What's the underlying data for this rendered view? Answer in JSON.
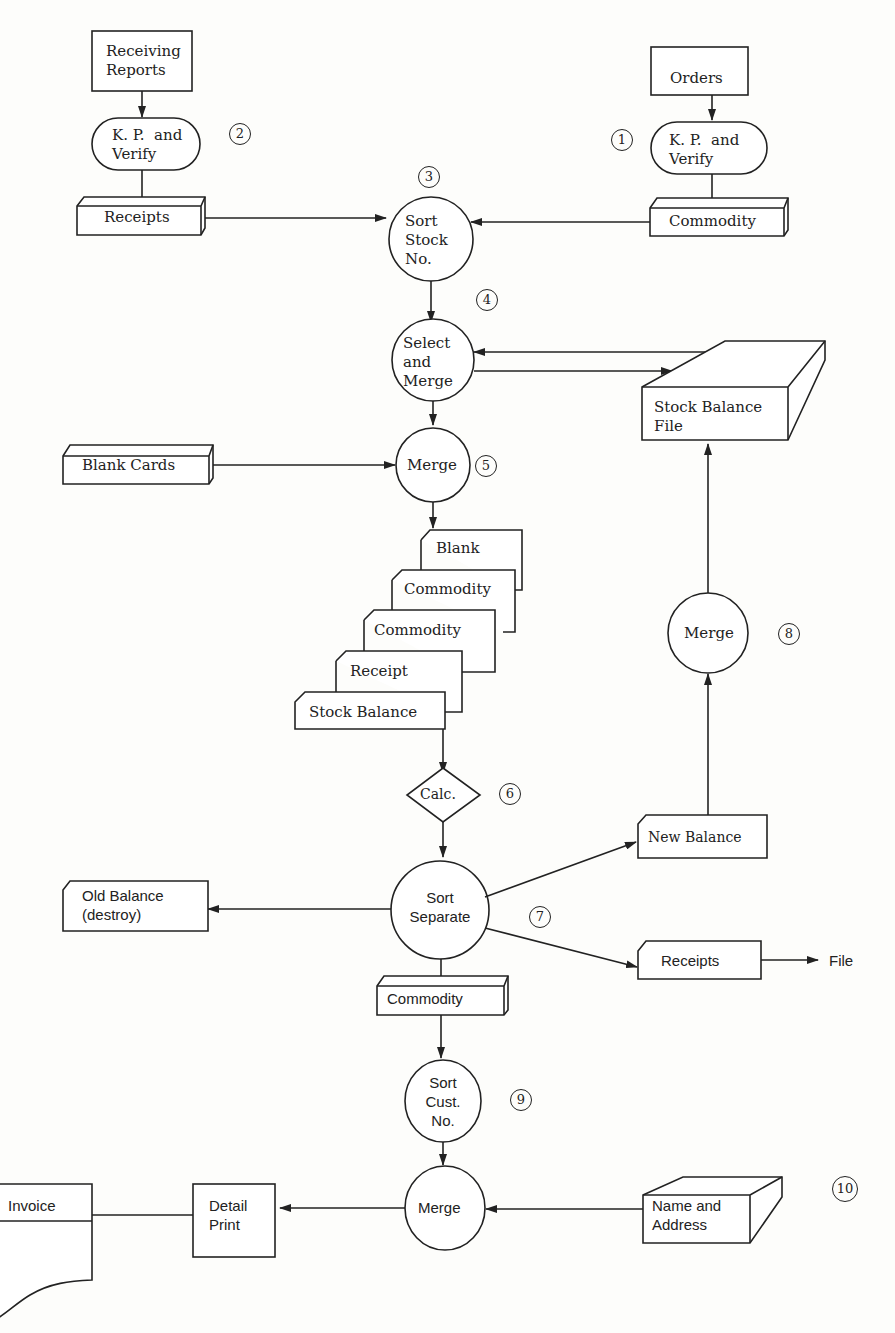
{
  "diagram": {
    "nodes": {
      "receiving_reports": "Receiving\nReports",
      "kp_verify_left": "K. P.  and\nVerify",
      "receipts_top": "Receipts",
      "orders": "Orders",
      "kp_verify_right": "K. P.  and\nVerify",
      "commodity_top": "Commodity",
      "sort_stock_no": "Sort\nStock\nNo.",
      "select_and_merge": "Select\nand\nMerge",
      "stock_balance_file": "Stock Balance\nFile",
      "blank_cards": "Blank Cards",
      "merge_5": "Merge",
      "deck_blank": "Blank",
      "deck_commodity_1": "Commodity",
      "deck_commodity_2": "Commodity",
      "deck_receipt": "Receipt",
      "deck_stock_balance": "Stock Balance",
      "calc": "Calc.",
      "merge_8": "Merge",
      "new_balance": "New Balance",
      "sort_separate": "Sort\nSeparate",
      "old_balance": "Old Balance\n(destroy)",
      "receipts_bottom": "Receipts",
      "file": "File",
      "commodity_bottom": "Commodity",
      "sort_cust_no": "Sort\nCust.\nNo.",
      "merge_final": "Merge",
      "name_and_address": "Name and\nAddress",
      "detail_print": "Detail\nPrint",
      "invoice": "Invoice"
    },
    "steps": [
      "1",
      "2",
      "3",
      "4",
      "5",
      "6",
      "7",
      "8",
      "9",
      "10"
    ]
  }
}
